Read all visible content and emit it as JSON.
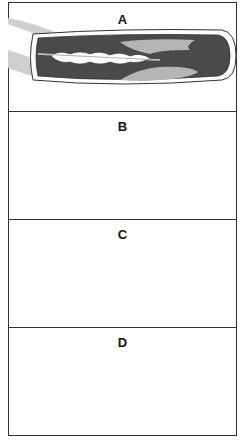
{
  "figure": {
    "panels": [
      {
        "label": "A",
        "description": "Guidewire passed through narrowed artery"
      },
      {
        "label": "B",
        "description": "Balloon catheter positioned in plaque"
      },
      {
        "label": "C",
        "description": "Balloon inflated, compressing plaque"
      },
      {
        "label": "D",
        "description": "Balloon removed, artery widened"
      }
    ]
  },
  "colors": {
    "border": "#333333",
    "lumen": "#4a4a4a",
    "plaque": "#b8b8b8",
    "vessel_wall": "#ffffff",
    "outer_vessel": "#c8c8c8"
  }
}
